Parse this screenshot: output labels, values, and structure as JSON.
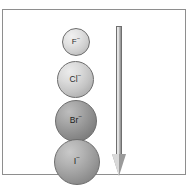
{
  "figure": {
    "caption": "",
    "background_color": "#ffffff",
    "frame": {
      "name": "diagram-border",
      "border_color": "#8e8e8e"
    }
  },
  "chart_data": {
    "type": "scatter",
    "title": "",
    "subtitle": "",
    "xlabel": "",
    "ylabel": "",
    "grid": false,
    "legend": "none",
    "categories": [
      "F⁻",
      "Cl⁻",
      "Br⁻",
      "I⁻"
    ],
    "values": [
      28,
      37,
      42,
      46
    ],
    "value_units": "px diameter (relative ionic size)",
    "series": [
      {
        "name": "Relative ionic radius",
        "values": [
          28,
          37,
          42,
          46
        ]
      }
    ],
    "points": [
      {
        "label_symbol": "F",
        "label_charge": "−",
        "order": 1,
        "diameter_px": 28,
        "fill_color": "#cfcfcf",
        "outline_color": "#6d6d6d"
      },
      {
        "label_symbol": "Cl",
        "label_charge": "−",
        "order": 2,
        "diameter_px": 37,
        "fill_color": "#c4c4c4",
        "outline_color": "#6d6d6d"
      },
      {
        "label_symbol": "Br",
        "label_charge": "−",
        "order": 3,
        "diameter_px": 42,
        "fill_color": "#8e8e8e",
        "outline_color": "#6d6d6d"
      },
      {
        "label_symbol": "I",
        "label_charge": "−",
        "order": 4,
        "diameter_px": 46,
        "fill_color": "#9b9b9b",
        "outline_color": "#6d6d6d"
      }
    ],
    "annotations": [
      {
        "name": "trend-arrow",
        "type": "arrow",
        "direction": "down",
        "text": "",
        "color": "#9a9a9a"
      }
    ]
  },
  "ions": {
    "fluoride": {
      "symbol": "F",
      "charge": "−"
    },
    "chloride": {
      "symbol": "Cl",
      "charge": "−"
    },
    "bromide": {
      "symbol": "Br",
      "charge": "−"
    },
    "iodide": {
      "symbol": "I",
      "charge": "−"
    }
  },
  "arrow": {
    "label": "",
    "direction": "down"
  }
}
